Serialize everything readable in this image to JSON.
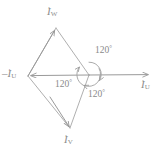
{
  "diagram": {
    "stroke_color": "#9a9a9a",
    "text_color": "#8c8c8c",
    "background": "#ffffff",
    "origin": {
      "x": 89,
      "y": 75
    }
  },
  "phasors": [
    {
      "id": "iw",
      "symbol": "I",
      "overdot": "˙",
      "subscript": "W",
      "label_text": "İW",
      "angle_deg": 120,
      "tip": {
        "x": 56,
        "y": 28
      }
    },
    {
      "id": "minus-iu",
      "prefix": "–",
      "symbol": "I",
      "overdot": "˙",
      "subscript": "U",
      "label_text": "–İU",
      "angle_deg": 180,
      "tip": {
        "x": 28,
        "y": 76
      }
    },
    {
      "id": "iu",
      "symbol": "I",
      "overdot": "˙",
      "subscript": "U",
      "label_text": "İU",
      "angle_deg": 0,
      "tip": {
        "x": 151,
        "y": 75
      }
    },
    {
      "id": "iv",
      "symbol": "I",
      "overdot": "˙",
      "subscript": "V",
      "label_text": "İV",
      "angle_deg": 240,
      "tip": {
        "x": 70,
        "y": 128
      }
    }
  ],
  "angles": [
    {
      "id": "angle-top",
      "value": "120",
      "unit": "°"
    },
    {
      "id": "angle-left",
      "value": "120",
      "unit": "°"
    },
    {
      "id": "angle-bottom",
      "value": "120",
      "unit": "°"
    }
  ],
  "rotation_indicator": {
    "name": "circular-arrow",
    "center": {
      "x": 89,
      "y": 74
    },
    "radius": 12,
    "direction": "clockwise"
  }
}
